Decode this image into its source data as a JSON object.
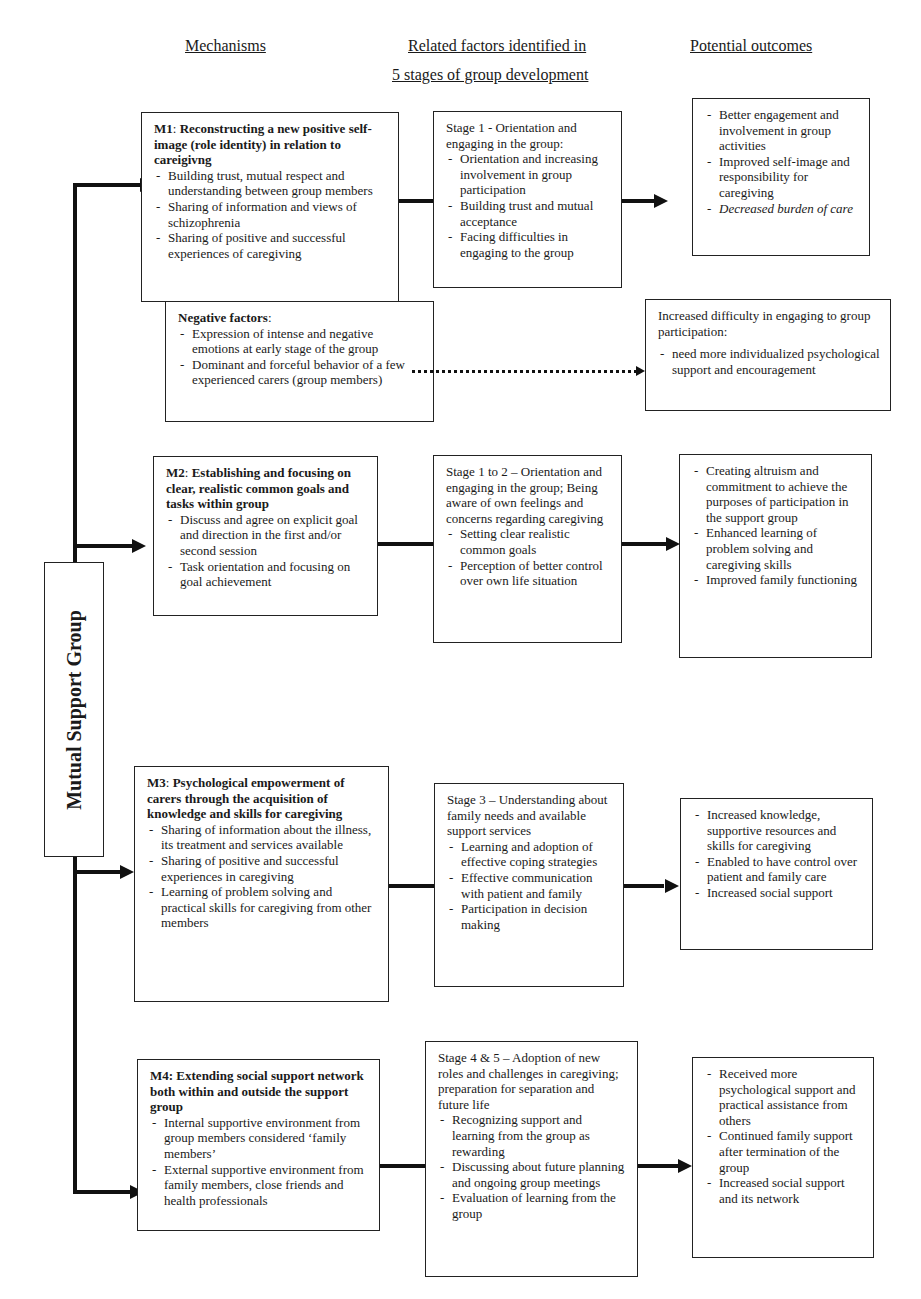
{
  "headers": {
    "mechanisms": "Mechanisms",
    "related_factors_line1": "Related factors identified in",
    "related_factors_line2": "5 stages of group development",
    "potential_outcomes": "Potential outcomes"
  },
  "root": {
    "label": "Mutual Support Group"
  },
  "rows": [
    {
      "mechanism": {
        "code": "M1",
        "title": "Reconstructing a new positive self-image (role identity) in relation to careigivng",
        "items": [
          "Building trust, mutual respect and understanding between group members",
          "Sharing of information and views of schizophrenia",
          "Sharing of positive and successful experiences of caregiving"
        ]
      },
      "stage": {
        "lead": "Stage 1 - Orientation and engaging in the group:",
        "items": [
          "Orientation and increasing involvement in group participation",
          "Building trust and mutual acceptance",
          "Facing difficulties in engaging to the group"
        ]
      },
      "outcome": {
        "items": [
          "Better engagement and involvement in group activities",
          "Improved self-image and responsibility for caregiving",
          "Decreased burden of care"
        ]
      }
    },
    {
      "mechanism": {
        "code": "M2",
        "title": "Establishing and focusing on clear, realistic common goals and tasks within group",
        "items": [
          "Discuss and agree on explicit goal and direction in the first and/or second session",
          "Task orientation and focusing on goal achievement"
        ]
      },
      "stage": {
        "lead": "Stage 1 to 2 – Orientation and engaging in the group; Being aware of own feelings and concerns regarding caregiving",
        "items": [
          "Setting clear realistic common goals",
          "Perception of better control over own life situation"
        ]
      },
      "outcome": {
        "items": [
          "Creating altruism and commitment to achieve the purposes of participation in the support group",
          "Enhanced learning of problem solving and caregiving skills",
          "Improved family functioning"
        ]
      }
    },
    {
      "mechanism": {
        "code": "M3",
        "title": "Psychological empowerment of carers through the acquisition of knowledge and skills for caregiving",
        "items": [
          "Sharing of information about the illness, its treatment and services available",
          "Sharing of positive and successful experiences in caregiving",
          "Learning of problem solving and practical skills for caregiving from other members"
        ]
      },
      "stage": {
        "lead": "Stage 3 – Understanding about family needs and available support services",
        "items": [
          "Learning and adoption of effective coping strategies",
          "Effective communication with patient and family",
          "Participation in decision making"
        ]
      },
      "outcome": {
        "items": [
          "Increased knowledge, supportive resources and skills for caregiving",
          "Enabled to have control over patient and family care",
          "Increased social support"
        ]
      }
    },
    {
      "mechanism": {
        "code": "M4:",
        "title": "Extending social support network both within and outside the support group",
        "items": [
          "Internal supportive environment from group members considered ‘family members’",
          "External supportive environment from family members, close friends and health professionals"
        ]
      },
      "stage": {
        "lead": "Stage 4 & 5 – Adoption of new roles and challenges in caregiving; preparation for separation and future life",
        "items": [
          "Recognizing support and learning from the group as rewarding",
          "Discussing about future planning and ongoing group meetings",
          "Evaluation of learning from the group"
        ]
      },
      "outcome": {
        "items": [
          "Received more psychological support and practical assistance from others",
          "Continued family support after termination of the group",
          "Increased social support and its network"
        ]
      }
    }
  ],
  "negative": {
    "title": "Negative factors",
    "colon": ":",
    "items": [
      "Expression of intense and negative emotions at early stage of the group",
      "Dominant and forceful behavior of a few experienced carers (group members)"
    ],
    "outcome_lead": "Increased difficulty in engaging to group participation:",
    "outcome_items": [
      "need more individualized psychological support and encouragement"
    ]
  }
}
